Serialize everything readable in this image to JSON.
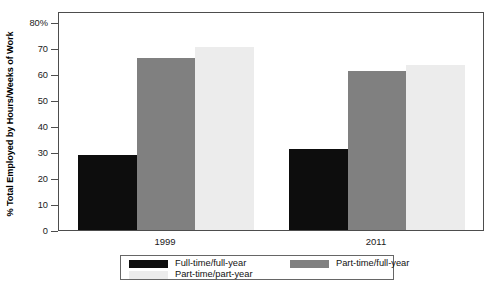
{
  "chart_data": {
    "type": "bar",
    "title": "",
    "xlabel": "",
    "ylabel": "% Total Employed by Hours/Weeks of Work",
    "categories": [
      "1999",
      "2011"
    ],
    "series": [
      {
        "name": "Full-time/full-year",
        "color": "#0d0d0d",
        "values": [
          28.8,
          31.2
        ]
      },
      {
        "name": "Part-time/full-year",
        "color": "#808080",
        "values": [
          66.3,
          61.0
        ]
      },
      {
        "name": "Part-time/part-year",
        "color": "#ececec",
        "values": [
          70.2,
          63.5
        ]
      }
    ],
    "ylim": [
      0,
      80
    ],
    "yticks": [
      0,
      10,
      20,
      30,
      40,
      50,
      60,
      70,
      80
    ],
    "ytick_labels": [
      "0",
      "10",
      "20",
      "30",
      "40",
      "50",
      "60",
      "70",
      "80%"
    ],
    "grid": false,
    "legend_position": "bottom-outside"
  },
  "legend": {
    "entries": [
      {
        "label": "Full-time/full-year",
        "swatch": "black"
      },
      {
        "label": "Part-time/full-year",
        "swatch": "dark"
      },
      {
        "label": "Part-time/part-year",
        "swatch": "light"
      }
    ]
  }
}
